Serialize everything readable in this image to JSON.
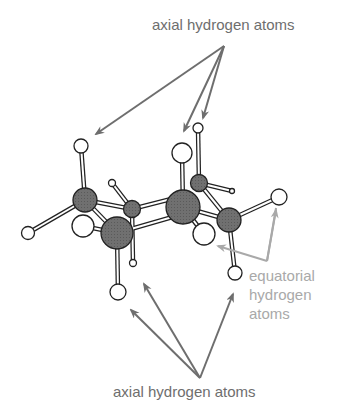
{
  "diagram": {
    "labels": {
      "axial_top": "axial hydrogen atoms",
      "axial_bottom": "axial hydrogen atoms",
      "equatorial_line1": "equatorial",
      "equatorial_line2": "hydrogen",
      "equatorial_line3": "atoms"
    },
    "colors": {
      "carbon_fill": "#6b6b6b",
      "hydrogen_fill": "#ffffff",
      "axial_arrow": "#6e6e6e",
      "equatorial_arrow": "#a9a9a9",
      "outline": "#222222"
    },
    "atoms": {
      "carbons": 6,
      "hydrogens": 12
    }
  }
}
